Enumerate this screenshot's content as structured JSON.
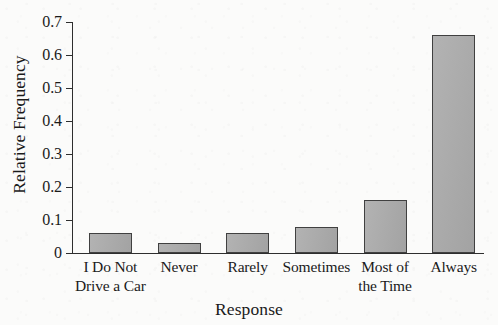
{
  "chart_data": {
    "type": "bar",
    "title": "",
    "xlabel": "Response",
    "ylabel": "Relative Frequency",
    "categories": [
      "I Do Not Drive a Car",
      "Never",
      "Rarely",
      "Sometimes",
      "Most of the Time",
      "Always"
    ],
    "category_lines": [
      [
        "I Do Not",
        "Drive a Car"
      ],
      [
        "Never",
        ""
      ],
      [
        "Rarely",
        ""
      ],
      [
        "Sometimes",
        ""
      ],
      [
        "Most of",
        "the Time"
      ],
      [
        "Always",
        ""
      ]
    ],
    "values": [
      0.06,
      0.03,
      0.06,
      0.08,
      0.16,
      0.66
    ],
    "ylim": [
      0,
      0.7
    ],
    "ytick_labels": [
      "0",
      "0.1",
      "0.2",
      "0.3",
      "0.4",
      "0.5",
      "0.6",
      "0.7"
    ],
    "ytick_values": [
      0,
      0.1,
      0.2,
      0.3,
      0.4,
      0.5,
      0.6,
      0.7
    ],
    "grid": false,
    "legend": false,
    "bar_color": "#aaaaaa",
    "bar_edge_color": "#404040",
    "axis_color": "#2e2e2e",
    "background_color": "#fbfbfa"
  }
}
